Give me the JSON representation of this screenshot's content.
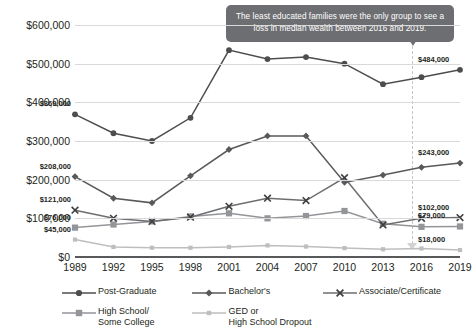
{
  "chart_data": {
    "type": "line",
    "title": "",
    "subtitle": "",
    "xlabel": "",
    "ylabel": "",
    "x": [
      1989,
      1992,
      1995,
      1998,
      2001,
      2004,
      2007,
      2010,
      2013,
      2016,
      2019
    ],
    "xticklabels": [
      "1989",
      "1992",
      "1995",
      "1998",
      "2001",
      "2004",
      "2007",
      "2010",
      "2013",
      "2016",
      "2019"
    ],
    "ylim": [
      0,
      600000
    ],
    "yticks": [
      0,
      100000,
      200000,
      300000,
      400000,
      500000,
      600000
    ],
    "yticklabels": [
      "$0",
      "$100,000",
      "$200,000",
      "$300,000",
      "$400,000",
      "$500,000",
      "$600,000"
    ],
    "grid": true,
    "legend_position": "bottom",
    "series": [
      {
        "name": "Post-Graduate",
        "color": "#4d4d4f",
        "marker": "circle",
        "values": [
          369000,
          320000,
          300000,
          360000,
          535000,
          512000,
          517000,
          500000,
          447000,
          465000,
          484000
        ],
        "start_label": "$369,000",
        "end_label": "$484,000"
      },
      {
        "name": "Bachelor's",
        "color": "#58595b",
        "marker": "diamond",
        "values": [
          208000,
          152000,
          140000,
          210000,
          278000,
          313000,
          313000,
          193000,
          212000,
          232000,
          243000
        ],
        "start_label": "$208,000",
        "end_label": "$243,000"
      },
      {
        "name": "Associate/Certificate",
        "color": "#6d6e71",
        "marker": "x",
        "values": [
          121000,
          100000,
          92000,
          103000,
          131000,
          152000,
          146000,
          205000,
          83000,
          100000,
          102000
        ],
        "start_label": "$121,000",
        "end_label": "$102,000"
      },
      {
        "name": "High School/\nSome College",
        "color": "#939598",
        "marker": "square",
        "values": [
          76000,
          84000,
          92000,
          105000,
          113000,
          100000,
          106000,
          119000,
          86000,
          78000,
          79000
        ],
        "start_label": "$76,000",
        "end_label": "$79,000"
      },
      {
        "name": "GED or\nHigh School Dropout",
        "color": "#bcbec0",
        "marker": "small-square",
        "values": [
          45000,
          26000,
          24000,
          24000,
          26000,
          30000,
          27000,
          23000,
          20000,
          22000,
          18000
        ],
        "start_label": "$45,000",
        "end_label": "$18,000"
      }
    ],
    "annotations": [
      {
        "text": "The least educated families were the only group to see a loss in median wealth between 2016 and 2019.",
        "points_to_x": 2016,
        "background": "#6d6e71",
        "text_color": "#ffffff"
      }
    ]
  },
  "legend": {
    "items": [
      {
        "label": "Post-Graduate"
      },
      {
        "label": "Bachelor's"
      },
      {
        "label": "Associate/Certificate"
      },
      {
        "label": "High School/\nSome College"
      },
      {
        "label": "GED or\nHigh School Dropout"
      }
    ]
  }
}
